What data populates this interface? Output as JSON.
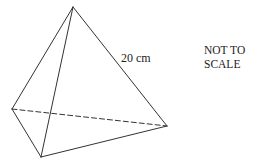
{
  "diagram": {
    "type": "tetrahedron",
    "vertices": {
      "apex": [
        73,
        7
      ],
      "left": [
        12,
        109
      ],
      "front": [
        41,
        157
      ],
      "right": [
        167,
        126
      ]
    },
    "edges": [
      {
        "from": "apex",
        "to": "left",
        "style": "solid"
      },
      {
        "from": "apex",
        "to": "front",
        "style": "solid"
      },
      {
        "from": "apex",
        "to": "right",
        "style": "solid"
      },
      {
        "from": "left",
        "to": "front",
        "style": "solid"
      },
      {
        "from": "front",
        "to": "right",
        "style": "solid"
      },
      {
        "from": "left",
        "to": "right",
        "style": "dashed"
      }
    ],
    "edge_label": "20 cm",
    "note_line1": "NOT TO",
    "note_line2": "SCALE",
    "stroke_color": "#333333"
  }
}
